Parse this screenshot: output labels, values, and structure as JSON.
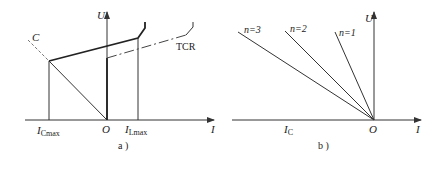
{
  "panel_a": {
    "caption": "a )",
    "axis_u_label": "U",
    "axis_i_label": "I",
    "origin_label": "O",
    "capacitor_label": "C",
    "tcr_label": "TCR",
    "i_cmax_label": {
      "main": "I",
      "sub": "Cmax"
    },
    "i_lmax_label": {
      "main": "I",
      "sub": "Lmax"
    }
  },
  "panel_b": {
    "caption": "b )",
    "axis_u_label": "U",
    "axis_i_label": "I",
    "origin_label": "O",
    "ic_label": {
      "main": "I",
      "sub": "C"
    },
    "lines": [
      {
        "label": "n=3"
      },
      {
        "label": "n=2"
      },
      {
        "label": "n=1"
      }
    ]
  },
  "colors": {
    "line": "#222222",
    "guide": "#777777",
    "background": "#ffffff"
  }
}
